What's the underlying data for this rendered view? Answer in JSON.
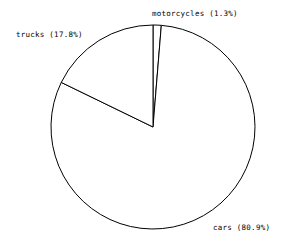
{
  "chart_data": {
    "type": "pie",
    "title": "",
    "subtitle": "",
    "xlabel": "",
    "ylabel": "",
    "grid": false,
    "legend": "none",
    "label_format": "{name} ({percent}%)",
    "start_angle_deg": 90,
    "direction": "clockwise",
    "categories": [
      "motorcycles",
      "cars",
      "trucks"
    ],
    "values": [
      1.3,
      80.9,
      17.8
    ],
    "unit": "%",
    "slices": [
      {
        "name": "motorcycles",
        "percent": 1.3,
        "label": "motorcycles (1.3%)",
        "fill": "#ffffff",
        "stroke": "#000000",
        "label_position": "top"
      },
      {
        "name": "cars",
        "percent": 80.9,
        "label": "cars (80.9%)",
        "fill": "#ffffff",
        "stroke": "#000000",
        "label_position": "bottom-right"
      },
      {
        "name": "trucks",
        "percent": 17.8,
        "label": "trucks (17.8%)",
        "fill": "#ffffff",
        "stroke": "#000000",
        "label_position": "top-left"
      }
    ],
    "geometry": {
      "center_x": 153,
      "center_y": 127,
      "radius": 102
    },
    "colors": {
      "background": "#ffffff",
      "stroke": "#000000",
      "text": "#000000"
    }
  },
  "figure": {
    "width": 293,
    "height": 250
  }
}
